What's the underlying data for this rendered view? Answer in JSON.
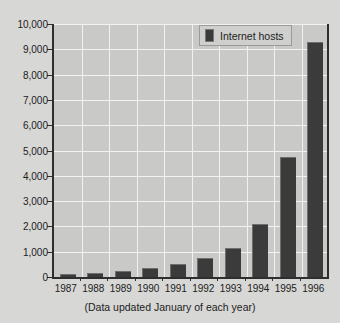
{
  "chart_data": {
    "type": "bar",
    "title": "",
    "subtitle": "",
    "xlabel": "",
    "ylabel": "",
    "categories": [
      "1987",
      "1988",
      "1989",
      "1990",
      "1991",
      "1992",
      "1993",
      "1994",
      "1995",
      "1996"
    ],
    "values": [
      100,
      150,
      250,
      350,
      500,
      750,
      1150,
      2100,
      4750,
      9300
    ],
    "series": [
      {
        "name": "Internet hosts",
        "values": [
          100,
          150,
          250,
          350,
          500,
          750,
          1150,
          2100,
          4750,
          9300
        ]
      }
    ],
    "ylim": [
      0,
      10000
    ],
    "ytick_values": [
      0,
      1000,
      2000,
      3000,
      4000,
      5000,
      6000,
      7000,
      8000,
      9000,
      10000
    ],
    "ytick_labels": [
      "0",
      "1,000",
      "2,000",
      "3,000",
      "4,000",
      "5,000",
      "6,000",
      "7,000",
      "8,000",
      "9,000",
      "10,000"
    ],
    "grid": true,
    "legend_position": "top-right",
    "bar_color": "#3b3b3b",
    "plot_background": "#c9c9c7",
    "gridline_color": "#f2f2f0",
    "axis_color": "#2e2e2e"
  },
  "legend": {
    "label": "Internet hosts"
  },
  "caption": {
    "text": "(Data updated January of each year)"
  }
}
